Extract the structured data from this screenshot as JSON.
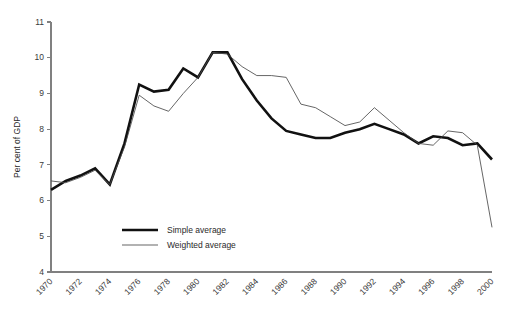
{
  "chart_data": {
    "type": "line",
    "title": "",
    "subtitle": "",
    "xlabel": "",
    "ylabel": "Per cent of GDP",
    "xlim": [
      1970,
      2000
    ],
    "ylim": [
      4,
      11
    ],
    "yticks": [
      4,
      5,
      6,
      7,
      8,
      9,
      10,
      11
    ],
    "ytick_labels": [
      "4",
      "5",
      "6",
      "7",
      "8",
      "9",
      "10",
      "11"
    ],
    "xticks": [
      1970,
      1972,
      1974,
      1976,
      1978,
      1980,
      1982,
      1984,
      1986,
      1988,
      1990,
      1992,
      1994,
      1996,
      1998,
      2000
    ],
    "xtick_labels": [
      "1970",
      "1972",
      "1974",
      "1976",
      "1978",
      "1980",
      "1982",
      "1984",
      "1986",
      "1988",
      "1990",
      "1992",
      "1994",
      "1996",
      "1998",
      "2000"
    ],
    "grid": false,
    "legend_position": "inside-lower-left",
    "x": [
      1970,
      1971,
      1972,
      1973,
      1974,
      1975,
      1976,
      1977,
      1978,
      1979,
      1980,
      1981,
      1982,
      1983,
      1984,
      1985,
      1986,
      1987,
      1988,
      1989,
      1990,
      1991,
      1992,
      1993,
      1994,
      1995,
      1996,
      1997,
      1998,
      1999,
      2000
    ],
    "series": [
      {
        "name": "Simple average",
        "style": "thick",
        "color": "#111111",
        "values": [
          6.3,
          6.55,
          6.7,
          6.9,
          6.45,
          7.6,
          9.25,
          9.05,
          9.1,
          9.7,
          9.45,
          10.15,
          10.15,
          9.4,
          8.8,
          8.3,
          7.95,
          7.85,
          7.75,
          7.75,
          7.9,
          8.0,
          8.15,
          8.0,
          7.85,
          7.6,
          7.8,
          7.75,
          7.55,
          7.6,
          7.15
        ]
      },
      {
        "name": "Weighted average",
        "style": "thin",
        "color": "#4a4a4a",
        "values": [
          6.55,
          6.5,
          6.65,
          6.85,
          6.45,
          7.5,
          8.95,
          8.65,
          8.5,
          9.0,
          9.45,
          10.15,
          10.1,
          9.75,
          9.5,
          9.5,
          9.45,
          8.7,
          8.6,
          8.35,
          8.1,
          8.2,
          8.6,
          8.25,
          7.9,
          7.6,
          7.55,
          7.95,
          7.9,
          7.55,
          5.25
        ]
      }
    ]
  },
  "legend": {
    "items": [
      {
        "label": "Simple average"
      },
      {
        "label": "Weighted average"
      }
    ]
  },
  "axes": {
    "y_title": "Per cent of GDP"
  }
}
